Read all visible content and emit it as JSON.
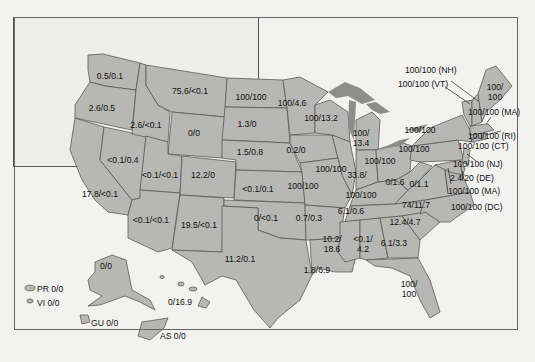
{
  "map": {
    "type": "choropleth-us-states",
    "fill": "#b5b5b5",
    "lake_fill": "#8a8a8a",
    "border": "#555555",
    "background": "#f2f2f0",
    "frame_bg": "#eeeeec"
  },
  "states": {
    "WA": "0.5/0.1",
    "OR": "2.6/0.5",
    "ID": "2.6/<0.1",
    "MT": "75.6/<0.1",
    "WY": "0/0",
    "CA": "17.8/<0.1",
    "NV": "<0.1/0.4",
    "UT": "<0.1/<0.1",
    "CO": "12.2/0",
    "AZ": "<0.1/<0.1",
    "NM": "19.5/<0.1",
    "ND": "100/100",
    "SD": "1.3/0",
    "NE": "1.5/0.8",
    "KS": "<0.1/0.1",
    "OK": "0/<0.1",
    "TX": "11.2/0.1",
    "MN": "100/4.6",
    "IA": "0.2/0",
    "MO": "100/100",
    "AR": "0.7/0.3",
    "LA": "1.8/6.9",
    "WI": "100/13.2",
    "IL": "100/100",
    "MI_line1": "100/",
    "MI_line2": "13.4",
    "IN_line1": "33.8/",
    "OH": "100/100",
    "KY": "100/100",
    "TN": "6.1/0.6",
    "MS_line1": "10.2/",
    "MS_line2": "18.6",
    "AL_line1": "<0.1/",
    "AL_line2": "4.2",
    "GA": "6.1/3.3",
    "FL_line1": "100/",
    "FL_line2": "100",
    "SC": "12.4/4.7",
    "NC": "74/11.7",
    "VA": "0/1.1",
    "WV": "0/1.6",
    "PA": "100/100",
    "NY": "100/100",
    "ME_line1": "100/",
    "ME_line2": "100",
    "AK": "0/0",
    "HI": "0/16.9"
  },
  "callouts": {
    "NH": "100/100 (NH)",
    "VT": "100/100 (VT)",
    "MA": "100/100 (MA)",
    "RI": "100/100 (RI)",
    "CT": "100/100 (CT)",
    "NJ": "100/100 (NJ)",
    "DE": "2.4/20 (DE)",
    "MD": "100/100 (MA)",
    "DC": "100/100 (DC)"
  },
  "territories": {
    "PR": "PR 0/0",
    "VI": "VI 0/0",
    "GU": "GU 0/0",
    "AS": "AS 0/0"
  }
}
